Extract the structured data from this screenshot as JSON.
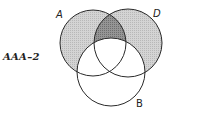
{
  "diagram": {
    "type": "venn",
    "caption": "AAA–2",
    "sets": [
      {
        "name": "A",
        "label": "A"
      },
      {
        "name": "D",
        "label": "D"
      },
      {
        "name": "B",
        "label": "B"
      }
    ],
    "shading": {
      "light_hatched": [
        "A only (not B)",
        "D only (not B)"
      ],
      "dark_hatched": [
        "A ∩ D (not B)"
      ],
      "unshaded": [
        "B"
      ]
    },
    "colors": {
      "light_fill": "#c9c9c9",
      "dark_fill": "#8a8a8a",
      "stroke": "#2a2a2a",
      "background": "#ffffff"
    }
  }
}
